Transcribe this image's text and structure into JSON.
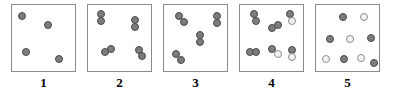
{
  "figure": {
    "title": "",
    "panel_count": 5,
    "colors": {
      "dot_dark": "#7d7d7d",
      "dot_dark_border": "#4a4a4a",
      "dot_light": "#f2f2f2",
      "dot_light_border": "#8e8e8e",
      "panel_border": "#8a8a8a",
      "background": "#ffffff",
      "label_color": "#000000"
    },
    "dot_diameter": 8,
    "panels": [
      {
        "label": "1",
        "box": {
          "x": 11,
          "y": 4,
          "w": 65,
          "h": 68
        },
        "description": "four separated dark circles",
        "dot_count": 4,
        "dots": [
          {
            "x": 18,
            "y": 12,
            "shade": "dark"
          },
          {
            "x": 44,
            "y": 21,
            "shade": "dark"
          },
          {
            "x": 22,
            "y": 48,
            "shade": "dark"
          },
          {
            "x": 55,
            "y": 55,
            "shade": "dark"
          }
        ]
      },
      {
        "label": "2",
        "box": {
          "x": 87,
          "y": 4,
          "w": 65,
          "h": 68
        },
        "description": "four dark pairs, loosely clustered",
        "dot_count": 8,
        "dots": [
          {
            "x": 97,
            "y": 10,
            "shade": "dark"
          },
          {
            "x": 97,
            "y": 17,
            "shade": "dark"
          },
          {
            "x": 131,
            "y": 16,
            "shade": "dark"
          },
          {
            "x": 131,
            "y": 23,
            "shade": "dark"
          },
          {
            "x": 101,
            "y": 48,
            "shade": "dark"
          },
          {
            "x": 107,
            "y": 45,
            "shade": "dark"
          },
          {
            "x": 135,
            "y": 46,
            "shade": "dark"
          },
          {
            "x": 138,
            "y": 52,
            "shade": "dark"
          }
        ]
      },
      {
        "label": "3",
        "box": {
          "x": 163,
          "y": 4,
          "w": 65,
          "h": 68
        },
        "description": "four dark pairs, tightly touching",
        "dot_count": 8,
        "dots": [
          {
            "x": 175,
            "y": 12,
            "shade": "dark"
          },
          {
            "x": 180,
            "y": 18,
            "shade": "dark"
          },
          {
            "x": 213,
            "y": 12,
            "shade": "dark"
          },
          {
            "x": 213,
            "y": 19,
            "shade": "dark"
          },
          {
            "x": 196,
            "y": 31,
            "shade": "dark"
          },
          {
            "x": 196,
            "y": 38,
            "shade": "dark"
          },
          {
            "x": 172,
            "y": 50,
            "shade": "dark"
          },
          {
            "x": 177,
            "y": 56,
            "shade": "dark"
          }
        ]
      },
      {
        "label": "4",
        "box": {
          "x": 239,
          "y": 4,
          "w": 65,
          "h": 68
        },
        "description": "five pairs, some with one light circle",
        "dot_count": 10,
        "dots": [
          {
            "x": 250,
            "y": 10,
            "shade": "dark"
          },
          {
            "x": 252,
            "y": 17,
            "shade": "dark"
          },
          {
            "x": 286,
            "y": 10,
            "shade": "dark"
          },
          {
            "x": 288,
            "y": 17,
            "shade": "light"
          },
          {
            "x": 268,
            "y": 24,
            "shade": "dark"
          },
          {
            "x": 274,
            "y": 21,
            "shade": "dark"
          },
          {
            "x": 246,
            "y": 48,
            "shade": "dark"
          },
          {
            "x": 252,
            "y": 48,
            "shade": "dark"
          },
          {
            "x": 268,
            "y": 45,
            "shade": "dark"
          },
          {
            "x": 274,
            "y": 50,
            "shade": "light"
          },
          {
            "x": 288,
            "y": 46,
            "shade": "dark"
          },
          {
            "x": 288,
            "y": 53,
            "shade": "light"
          }
        ]
      },
      {
        "label": "5",
        "box": {
          "x": 315,
          "y": 4,
          "w": 65,
          "h": 68
        },
        "description": "ten evenly dispersed circles alternating dark and light",
        "dot_count": 10,
        "dots": [
          {
            "x": 339,
            "y": 13,
            "shade": "dark"
          },
          {
            "x": 360,
            "y": 13,
            "shade": "light"
          },
          {
            "x": 326,
            "y": 35,
            "shade": "dark"
          },
          {
            "x": 346,
            "y": 35,
            "shade": "light"
          },
          {
            "x": 367,
            "y": 34,
            "shade": "dark"
          },
          {
            "x": 322,
            "y": 55,
            "shade": "light"
          },
          {
            "x": 340,
            "y": 55,
            "shade": "dark"
          },
          {
            "x": 357,
            "y": 54,
            "shade": "light"
          },
          {
            "x": 370,
            "y": 59,
            "shade": "dark"
          }
        ]
      }
    ]
  }
}
